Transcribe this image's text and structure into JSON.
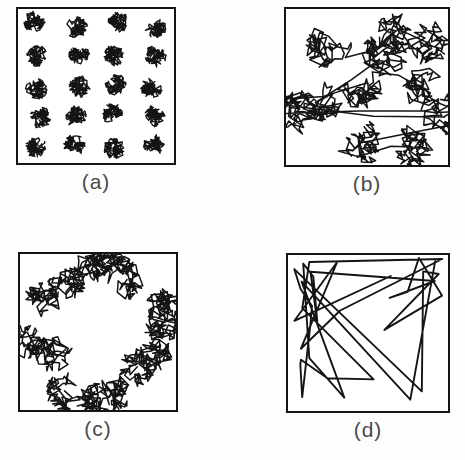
{
  "figure": {
    "width": 465,
    "height": 460,
    "background_color": "#fdfdfd",
    "ink_color": "#141414",
    "caption_color": "#4a4a4a",
    "panel_fill": "#ffffff",
    "type": "random-walk-trajectory-panels",
    "panel_count": 4
  },
  "panels": [
    {
      "id": "a",
      "caption": "(a)",
      "frame": {
        "x": 16,
        "y": 7,
        "width": 160,
        "height": 158
      },
      "caption_box": {
        "x": 16,
        "y": 169,
        "width": 160,
        "height": 26
      },
      "pattern": "regular-grid-of-dense-clusters",
      "description": "Brownian-like walk: many short steps forming tight dense clusters arranged on a regular lattice",
      "cluster_layout": "grid",
      "grid_cols": 4,
      "grid_rows": 5,
      "cluster_count": 20,
      "cluster_radius": 11,
      "steps_per_cluster": 150,
      "step_length": 3.1,
      "stroke_width": 1.35,
      "connect_clusters": false,
      "seed": 1701
    },
    {
      "id": "b",
      "caption": "(b)",
      "frame": {
        "x": 284,
        "y": 7,
        "width": 166,
        "height": 160
      },
      "caption_box": {
        "x": 284,
        "y": 171,
        "width": 166,
        "height": 26
      },
      "pattern": "scattered-loose-clusters-with-connecting-strands",
      "description": "Levy flight: loose open clusters of intermediate size scattered irregularly, joined by long connecting strands",
      "cluster_layout": "scatter",
      "cluster_count": 11,
      "cluster_radius": 24,
      "steps_per_cluster": 70,
      "step_length": 8.5,
      "stroke_width": 1.5,
      "connect_clusters": true,
      "seed": 2207,
      "cluster_centers": [
        {
          "x": 42,
          "y": 38
        },
        {
          "x": 110,
          "y": 22
        },
        {
          "x": 142,
          "y": 34
        },
        {
          "x": 98,
          "y": 46
        },
        {
          "x": 32,
          "y": 92
        },
        {
          "x": 74,
          "y": 76
        },
        {
          "x": 137,
          "y": 80
        },
        {
          "x": 10,
          "y": 104
        },
        {
          "x": 158,
          "y": 108
        },
        {
          "x": 74,
          "y": 134
        },
        {
          "x": 126,
          "y": 138
        }
      ]
    },
    {
      "id": "c",
      "caption": "(c)",
      "frame": {
        "x": 18,
        "y": 252,
        "width": 160,
        "height": 160
      },
      "caption_box": {
        "x": 18,
        "y": 416,
        "width": 160,
        "height": 26
      },
      "pattern": "annulus-ring-of-clusters-with-empty-center",
      "description": "Clusters distributed around the perimeter forming a ring, leaving a void at the centre",
      "cluster_layout": "ring",
      "cluster_count": 14,
      "ring_radius": 62,
      "ring_radius_jitter": 12,
      "cluster_radius": 20,
      "steps_per_cluster": 72,
      "step_length": 7.6,
      "stroke_width": 1.5,
      "connect_clusters": false,
      "seed": 3313
    },
    {
      "id": "d",
      "caption": "(d)",
      "frame": {
        "x": 286,
        "y": 253,
        "width": 164,
        "height": 160
      },
      "caption_box": {
        "x": 286,
        "y": 417,
        "width": 164,
        "height": 26
      },
      "pattern": "sparse-long-straight-line-walk",
      "description": "Extremely heavy-tailed walk: a single trajectory of very long straight steps crossing the whole box",
      "cluster_layout": "single-walk",
      "cluster_count": 1,
      "steps_per_cluster": 34,
      "step_length": 150,
      "stroke_width": 1.9,
      "connect_clusters": false,
      "seed": 4421
    }
  ]
}
